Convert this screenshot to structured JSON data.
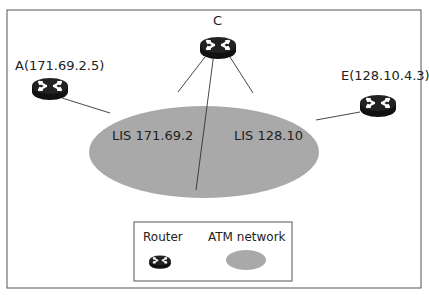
{
  "diagram": {
    "routers": [
      {
        "id": "A",
        "label": "A(171.69.2.5)"
      },
      {
        "id": "C",
        "label": "C"
      },
      {
        "id": "E",
        "label": "E(128.10.4.3)"
      }
    ],
    "network": {
      "left_lis": "LIS 171.69.2",
      "right_lis": "LIS 128.10"
    },
    "legend": {
      "router_label": "Router",
      "atm_label": "ATM network"
    },
    "colors": {
      "ellipse": "#a9a9a9",
      "router": "#111111",
      "frame": "#555555"
    }
  }
}
